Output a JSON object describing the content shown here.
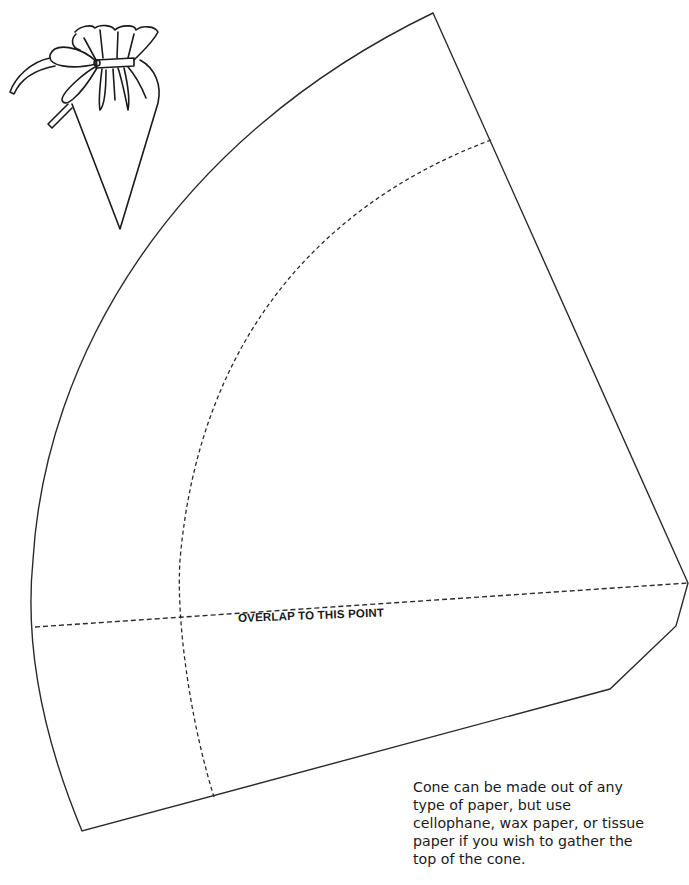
{
  "template": {
    "type": "cone-cutout-pattern",
    "overlap_label": "OVERLAP TO THIS POINT",
    "instructions_lines": [
      "Cone can be made out of any",
      "type of paper, but use",
      "cellophane, wax paper, or tissue",
      "paper if you wish to gather the",
      "top of the cone."
    ]
  },
  "illustration": {
    "subject": "finished-gathered-cone-with-bow"
  },
  "colors": {
    "line": "#2a2a2a",
    "background": "#ffffff"
  }
}
